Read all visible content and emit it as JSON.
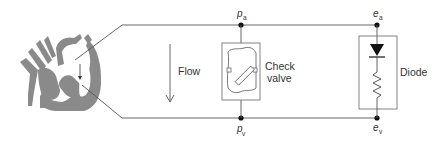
{
  "diagram": {
    "flow_label": "Flow",
    "check_valve_label_line1": "Check",
    "check_valve_label_line2": "valve",
    "diode_label": "Diode",
    "node_top_pressure": {
      "symbol": "p",
      "subscript": "a"
    },
    "node_bottom_pressure": {
      "symbol": "p",
      "subscript": "v"
    },
    "node_top_voltage": {
      "symbol": "e",
      "subscript": "a"
    },
    "node_bottom_voltage": {
      "symbol": "e",
      "subscript": "v"
    }
  },
  "colors": {
    "line": "#555555",
    "heart": "#8a8a8a",
    "text": "#333333"
  }
}
